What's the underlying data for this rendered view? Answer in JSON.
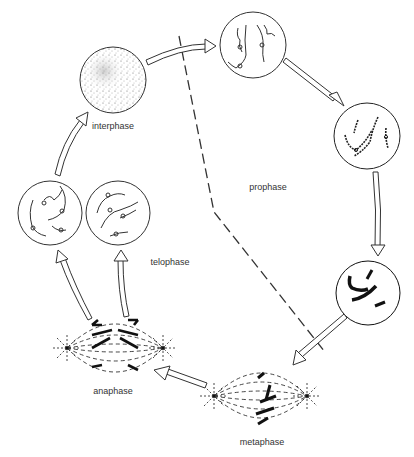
{
  "diagram": {
    "type": "cycle",
    "labels": {
      "interphase": "interphase",
      "prophase": "prophase",
      "metaphase": "metaphase",
      "anaphase": "anaphase",
      "telophase": "telophase"
    },
    "stages": [
      {
        "id": "interphase",
        "label": "interphase",
        "depiction": "stippled nucleus"
      },
      {
        "id": "prophase-early",
        "label": "",
        "depiction": "thin chromatin threads"
      },
      {
        "id": "prophase-mid",
        "label": "",
        "depiction": "condensing beaded chromosomes"
      },
      {
        "id": "prophase-late",
        "label": "",
        "depiction": "condensed chromosomes"
      },
      {
        "id": "metaphase",
        "label": "metaphase",
        "depiction": "chromosomes aligned on spindle"
      },
      {
        "id": "anaphase",
        "label": "anaphase",
        "depiction": "chromatids moving to poles"
      },
      {
        "id": "telophase",
        "label": "telophase",
        "depiction": "two daughter nuclei"
      }
    ],
    "edges": [
      {
        "from": "interphase",
        "to": "prophase-early"
      },
      {
        "from": "prophase-early",
        "to": "prophase-mid"
      },
      {
        "from": "prophase-mid",
        "to": "prophase-late"
      },
      {
        "from": "prophase-late",
        "to": "metaphase"
      },
      {
        "from": "metaphase",
        "to": "anaphase"
      },
      {
        "from": "anaphase",
        "to": "telophase"
      },
      {
        "from": "telophase",
        "to": "interphase"
      }
    ],
    "colors": {
      "line": "#333333",
      "background": "#ffffff"
    }
  }
}
